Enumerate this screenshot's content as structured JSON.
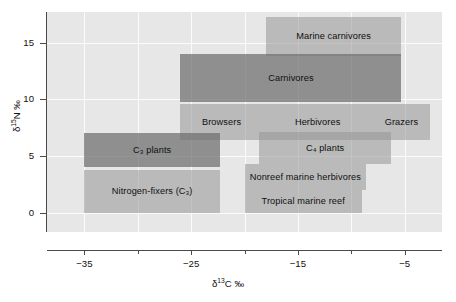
{
  "chart_data": {
    "type": "bar",
    "title": "",
    "xlabel": "δ¹³C ‰",
    "ylabel": "δ¹⁵N ‰",
    "xlim": [
      -38.5,
      -1.5
    ],
    "ylim": [
      -1.7,
      17.7
    ],
    "grid": true,
    "legend": "none",
    "xticks": [
      -35,
      -25,
      -15,
      -5
    ],
    "xticks_minor": [
      -30,
      -20,
      -10
    ],
    "yticks": [
      0,
      5,
      10,
      15
    ],
    "boxes": [
      {
        "label": "Marine carnivores",
        "x0": -18.0,
        "x1": -5.3,
        "y0": 13.8,
        "y1": 17.3,
        "shade": "light"
      },
      {
        "label": "Carnivores",
        "x0": -26.0,
        "x1": -5.3,
        "y0": 9.8,
        "y1": 14.0,
        "shade": "dark"
      },
      {
        "label": "Browsers",
        "x0": -26.0,
        "x1": -18.3,
        "y0": 6.4,
        "y1": 9.6,
        "shade": "light"
      },
      {
        "label": "Herbivores",
        "x0": -18.3,
        "x1": -8.0,
        "y0": 6.4,
        "y1": 9.6,
        "shade": "light"
      },
      {
        "label": "Grazers",
        "x0": -8.0,
        "x1": -2.6,
        "y0": 6.4,
        "y1": 9.6,
        "shade": "light"
      },
      {
        "label": "C₃ plants",
        "x0": -35.0,
        "x1": -22.3,
        "y0": 4.0,
        "y1": 7.0,
        "shade": "dark"
      },
      {
        "label": "C₄ plants",
        "x0": -18.6,
        "x1": -6.3,
        "y0": 4.3,
        "y1": 7.1,
        "shade": "light"
      },
      {
        "label": "Nonreef marine herbivores",
        "x0": -20.0,
        "x1": -8.6,
        "y0": 2.0,
        "y1": 4.3,
        "shade": "light"
      },
      {
        "label": "Nitrogen-fixers (C₃)",
        "x0": -35.0,
        "x1": -22.3,
        "y0": 0.0,
        "y1": 3.8,
        "shade": "light"
      },
      {
        "label": "Tropical marine reef",
        "x0": -20.0,
        "x1": -9.0,
        "y0": 0.0,
        "y1": 2.0,
        "shade": "light"
      }
    ]
  },
  "axes": {
    "y_tick_labels": [
      "0",
      "5",
      "10",
      "15"
    ],
    "x_tick_labels": [
      "−35",
      "−25",
      "−15",
      "−5"
    ]
  },
  "colors": {
    "panel_background": "#e7e7e7",
    "gridline": "#fbfbfb",
    "box_light": "rgba(150,150,150,0.55)",
    "box_dark": "rgba(110,110,110,0.72)",
    "axis": "#4a4a4a",
    "text": "#111111"
  }
}
